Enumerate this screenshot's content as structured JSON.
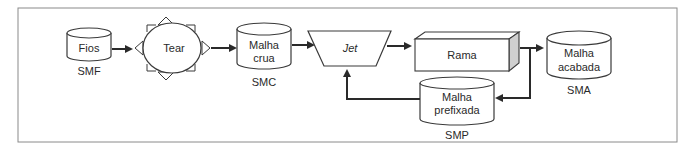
{
  "diagram": {
    "nodes": {
      "fios": {
        "label": "Fios",
        "caption": "SMF",
        "shape": "cylinder"
      },
      "tear": {
        "label": "Tear",
        "shape": "ellipse-with-triangles"
      },
      "malha_crua": {
        "label_line1": "Malha",
        "label_line2": "crua",
        "caption": "SMC",
        "shape": "cylinder"
      },
      "jet": {
        "label": "Jet",
        "shape": "trapezoid"
      },
      "rama": {
        "label": "Rama",
        "shape": "3d-box"
      },
      "malha_acabada": {
        "label_line1": "Malha",
        "label_line2": "acabada",
        "caption": "SMA",
        "shape": "cylinder"
      },
      "malha_prefixada": {
        "label_line1": "Malha",
        "label_line2": "prefixada",
        "caption": "SMP",
        "shape": "cylinder"
      }
    },
    "edges": [
      {
        "from": "Fios",
        "to": "Tear"
      },
      {
        "from": "Tear",
        "to": "Malha crua"
      },
      {
        "from": "Malha crua",
        "to": "Jet"
      },
      {
        "from": "Jet",
        "to": "Rama"
      },
      {
        "from": "Rama",
        "to": "Malha acabada"
      },
      {
        "from": "Rama",
        "to": "Malha prefixada"
      },
      {
        "from": "Malha prefixada",
        "to": "Jet"
      }
    ],
    "colors": {
      "stroke": "#3a3a3a",
      "arrow": "#2a2a2a",
      "box_side": "#cfcfcf",
      "frame": "#8a8a8a"
    }
  }
}
